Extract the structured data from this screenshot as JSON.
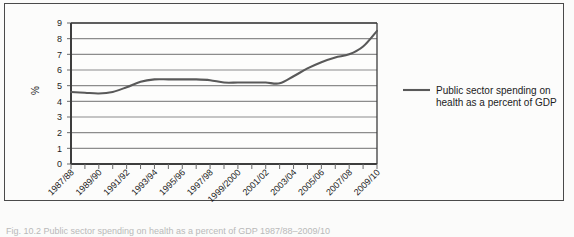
{
  "figure": {
    "caption": "Fig. 10.2 Public sector spending on health as a percent of GDP 1987/88–2009/10",
    "border_color": "#4a4a4a",
    "background": "#fcfcfb"
  },
  "legend": {
    "position": "right",
    "entries": [
      {
        "label_line1": "Public sector spending on",
        "label_line2": "health as a percent of GDP",
        "color": "#595959",
        "swatch": "line-swatch"
      }
    ]
  },
  "chart_data": {
    "type": "line",
    "title": "",
    "subtitle": "",
    "xlabel": "",
    "ylabel": "%",
    "ylim": [
      0,
      9
    ],
    "ytick_values": [
      0,
      1,
      2,
      3,
      4,
      5,
      6,
      7,
      8,
      9
    ],
    "ytick_labels": [
      "0",
      "1",
      "2",
      "3",
      "4",
      "5",
      "6",
      "7",
      "8",
      "9"
    ],
    "grid": true,
    "grid_color": "#8c8c8c",
    "legend_position": "right",
    "x": [
      "1987/88",
      "1988/89",
      "1989/90",
      "1990/91",
      "1991/92",
      "1992/93",
      "1993/94",
      "1994/95",
      "1995/96",
      "1996/97",
      "1997/98",
      "1998/99",
      "1999/2000",
      "2000/01",
      "2001/02",
      "2002/03",
      "2003/04",
      "2004/05",
      "2005/06",
      "2006/07",
      "2007/08",
      "2008/09",
      "2009/10"
    ],
    "xtick_labels_shown": [
      "1987/88",
      "1989/90",
      "1991/92",
      "1993/94",
      "1995/96",
      "1997/98",
      "1999/2000",
      "2001/02",
      "2003/04",
      "2005/06",
      "2007/08",
      "2009/10"
    ],
    "series": [
      {
        "name": "Public sector spending on health as a percent of GDP",
        "color": "#595959",
        "values": [
          4.6,
          4.55,
          4.5,
          4.6,
          4.9,
          5.25,
          5.4,
          5.4,
          5.4,
          5.4,
          5.35,
          5.2,
          5.2,
          5.2,
          5.2,
          5.15,
          5.6,
          6.1,
          6.5,
          6.8,
          7.0,
          7.5,
          8.5
        ]
      }
    ]
  }
}
